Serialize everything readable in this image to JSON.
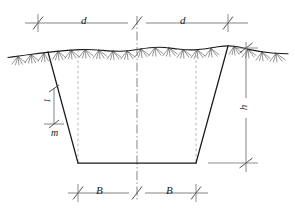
{
  "diagram": {
    "type": "engineering-cross-section",
    "colors": {
      "outline": "#1a1a1a",
      "ground_line": "#1a1a1a",
      "hatch": "#4a4a4a",
      "dimension_line": "#6e6e6e",
      "dashed_line": "#9a9a9a",
      "center_line": "#6e6e6e",
      "background": "#ffffff"
    },
    "labels": {
      "top_left_dim": "d",
      "top_right_dim": "d",
      "bottom_left_dim": "B",
      "bottom_right_dim": "B",
      "depth_dim": "h",
      "slope_run": "m",
      "slope_rise": "1"
    }
  },
  "geometry": {
    "ground": {
      "y_base": 57,
      "x_start": 8,
      "x_end": 288
    },
    "trench": {
      "top_left": [
        48,
        52
      ],
      "top_right": [
        228,
        46
      ],
      "bottom_left": [
        78,
        163
      ],
      "bottom_right": [
        196,
        163
      ]
    },
    "centerline": {
      "x": 137,
      "y_top": 16,
      "y_bottom": 202
    },
    "dimensions": {
      "top_line_y": 23,
      "top_ticks_x": [
        38,
        137,
        228
      ],
      "bottom_line_y": 193,
      "bottom_ticks_x": [
        78,
        137,
        196
      ],
      "right_line_x": 246,
      "right_ticks_y": [
        48,
        163
      ]
    }
  }
}
